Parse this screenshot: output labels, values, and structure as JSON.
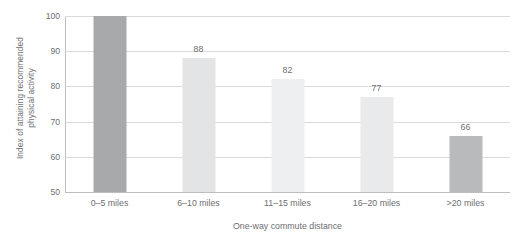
{
  "chart_data": {
    "type": "bar",
    "title": "",
    "subtitle": "",
    "xlabel": "One-way commute distance",
    "ylabel": "Index of attaining recommended physical activity",
    "ylabel_line1": "Index of attaining recommended",
    "ylabel_line2": "physical activity",
    "categories": [
      "0–5 miles",
      "6–10 miles",
      "11–15 miles",
      "16–20 miles",
      ">20 miles"
    ],
    "values": [
      100,
      88,
      82,
      77,
      66
    ],
    "data_labels": [
      "",
      "88",
      "82",
      "77",
      "66"
    ],
    "bar_colors": [
      "#a8a9ab",
      "#e3e4e5",
      "#eeeff0",
      "#e9eaeb",
      "#b9babc"
    ],
    "ylim": [
      50,
      100
    ],
    "yticks": [
      100,
      90,
      80,
      70,
      60,
      50
    ],
    "ytick_labels": [
      "100",
      "90",
      "80",
      "70",
      "60",
      "50"
    ],
    "grid": true,
    "legend": "none",
    "gridline_color": "#d9dadb",
    "axis_color": "#bcbdbf",
    "text_color": "#6d6e71"
  }
}
